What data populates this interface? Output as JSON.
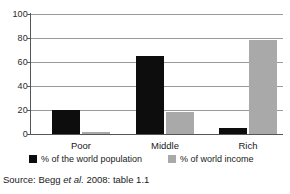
{
  "chart_data": {
    "type": "bar",
    "title": "",
    "subtitle": "",
    "xlabel": "",
    "ylabel": "",
    "ylim": [
      0,
      100
    ],
    "yticks": [
      0,
      20,
      40,
      60,
      80,
      100
    ],
    "ytick_labels": [
      "0",
      "20",
      "40",
      "60",
      "80",
      "100"
    ],
    "grid": true,
    "grid_axis": "y",
    "legend_position": "bottom",
    "categories": [
      "Poor",
      "Middle",
      "Rich"
    ],
    "series": [
      {
        "name": "% of the world population",
        "color": "#0d0d0d",
        "values": [
          20,
          65,
          5
        ]
      },
      {
        "name": "% of world income",
        "color": "#a9a9a9",
        "values": [
          1.5,
          18,
          78
        ]
      }
    ],
    "annotations": []
  },
  "legend": {
    "items": [
      {
        "label": "% of the world population",
        "color": "#0d0d0d"
      },
      {
        "label": "% of world income",
        "color": "#a9a9a9"
      }
    ]
  },
  "source": {
    "prefix": "Source: Begg ",
    "italic": "et al.",
    "suffix": " 2008: table 1.1"
  },
  "colors": {
    "population_series": "#0d0d0d",
    "income_series": "#a9a9a9",
    "gridline": "#9a9a9a",
    "axis": "#555555",
    "background": "#ffffff",
    "text": "#1a1a1a"
  }
}
